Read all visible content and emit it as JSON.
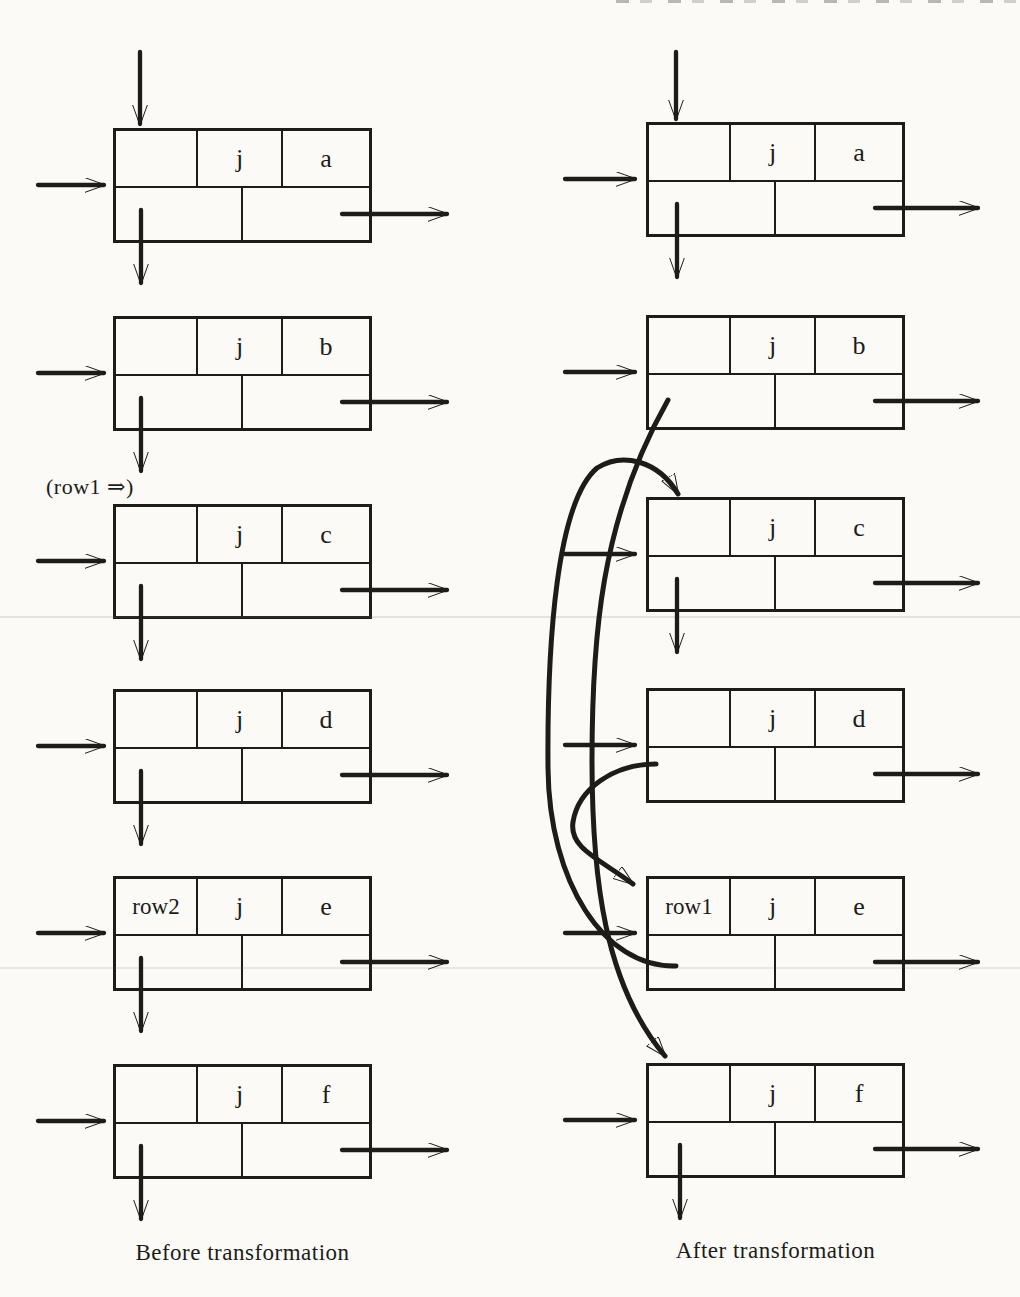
{
  "colors": {
    "ink": "#1c1c1a",
    "paper": "#fbfaf6"
  },
  "before": {
    "caption": "Before transformation",
    "pointer_label": "(row1 ⇒)",
    "nodes": [
      {
        "left": "",
        "tag": "j",
        "value": "a"
      },
      {
        "left": "",
        "tag": "j",
        "value": "b"
      },
      {
        "left": "",
        "tag": "j",
        "value": "c"
      },
      {
        "left": "",
        "tag": "j",
        "value": "d"
      },
      {
        "left": "row2",
        "tag": "j",
        "value": "e"
      },
      {
        "left": "",
        "tag": "j",
        "value": "f"
      }
    ]
  },
  "after": {
    "caption": "After transformation",
    "nodes": [
      {
        "left": "",
        "tag": "j",
        "value": "a"
      },
      {
        "left": "",
        "tag": "j",
        "value": "b"
      },
      {
        "left": "",
        "tag": "j",
        "value": "c"
      },
      {
        "left": "",
        "tag": "j",
        "value": "d"
      },
      {
        "left": "row1",
        "tag": "j",
        "value": "e"
      },
      {
        "left": "",
        "tag": "j",
        "value": "f"
      }
    ],
    "curved_links": [
      {
        "from": "node-b-down-field",
        "to": "node-f-top"
      },
      {
        "from": "node-e-down-field",
        "to": "node-c-top"
      },
      {
        "from": "node-d-down-field",
        "to": "node-e-top"
      }
    ]
  }
}
